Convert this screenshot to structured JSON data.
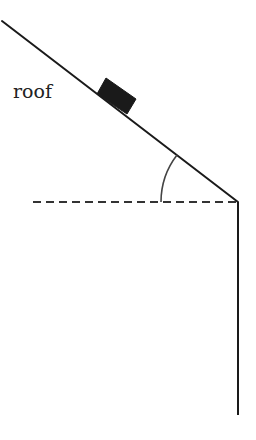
{
  "diagram": {
    "type": "inclined-roof-block",
    "labels": {
      "roof": "roof"
    },
    "colors": {
      "line": "#1a1a1a",
      "block": "#1a1a1a",
      "dashed": "#333333",
      "arc": "#444444",
      "background": "#ffffff"
    },
    "elements": [
      {
        "name": "roof-line",
        "kind": "solid-line",
        "from": [
          2,
          21
        ],
        "to": [
          238,
          202
        ]
      },
      {
        "name": "wall-line",
        "kind": "solid-line",
        "from": [
          238,
          202
        ],
        "to": [
          238,
          415
        ]
      },
      {
        "name": "horizontal-reference",
        "kind": "dashed-line",
        "from": [
          33,
          202
        ],
        "to": [
          238,
          202
        ]
      },
      {
        "name": "angle-arc",
        "kind": "arc",
        "center": [
          238,
          202
        ],
        "radius": 77
      },
      {
        "name": "block",
        "kind": "rectangle-on-incline"
      }
    ]
  }
}
